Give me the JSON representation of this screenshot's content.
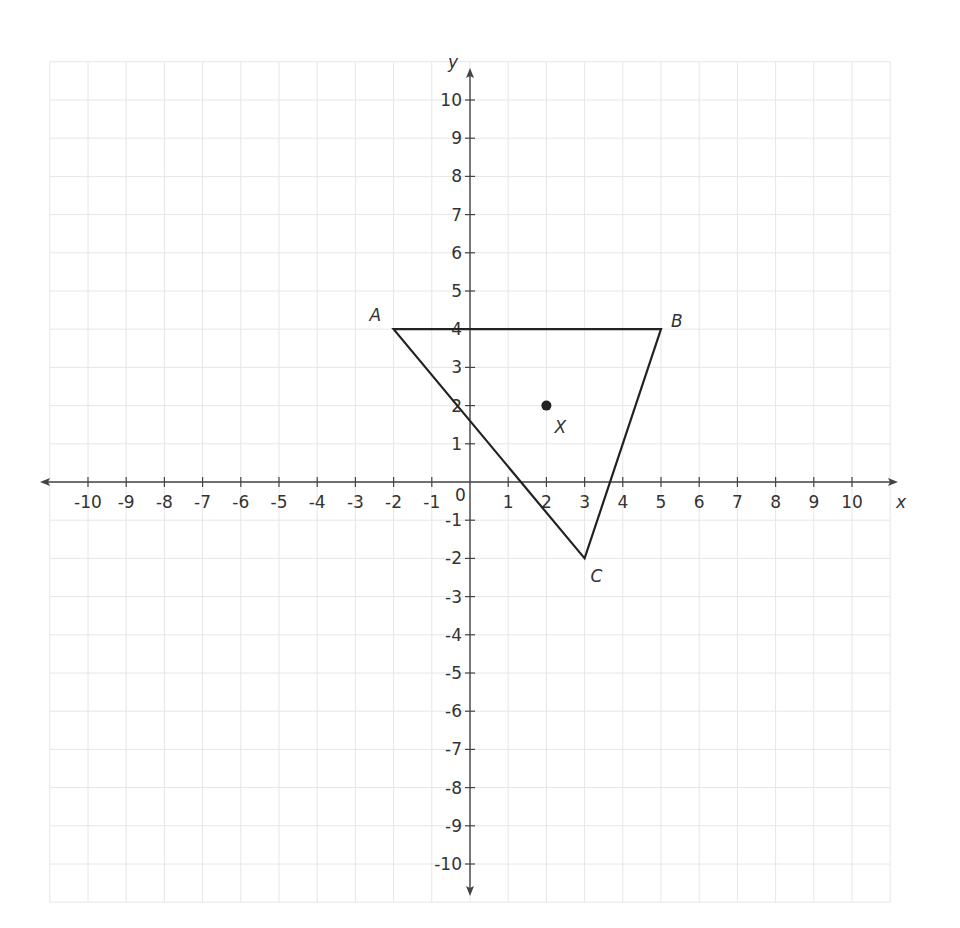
{
  "chart_data": {
    "type": "scatter",
    "title": "",
    "xlabel": "x",
    "ylabel": "y",
    "xlim": [
      -11,
      11
    ],
    "ylim": [
      -11,
      11
    ],
    "grid": true,
    "x_ticks": [
      -10,
      -9,
      -8,
      -7,
      -6,
      -5,
      -4,
      -3,
      -2,
      -1,
      1,
      2,
      3,
      4,
      5,
      6,
      7,
      8,
      9,
      10
    ],
    "y_ticks": [
      -10,
      -9,
      -8,
      -7,
      -6,
      -5,
      -4,
      -3,
      -2,
      -1,
      1,
      2,
      3,
      4,
      5,
      6,
      7,
      8,
      9,
      10
    ],
    "origin_label": "0",
    "polygon": {
      "name": "triangle ABC",
      "vertices": [
        {
          "label": "A",
          "x": -2,
          "y": 4
        },
        {
          "label": "B",
          "x": 5,
          "y": 4
        },
        {
          "label": "C",
          "x": 3,
          "y": -2
        }
      ]
    },
    "points": [
      {
        "label": "X",
        "x": 2,
        "y": 2
      }
    ]
  },
  "colors": {
    "grid": "#e6e6e6",
    "axis": "#444444",
    "shape": "#222222",
    "text": "#333333"
  }
}
